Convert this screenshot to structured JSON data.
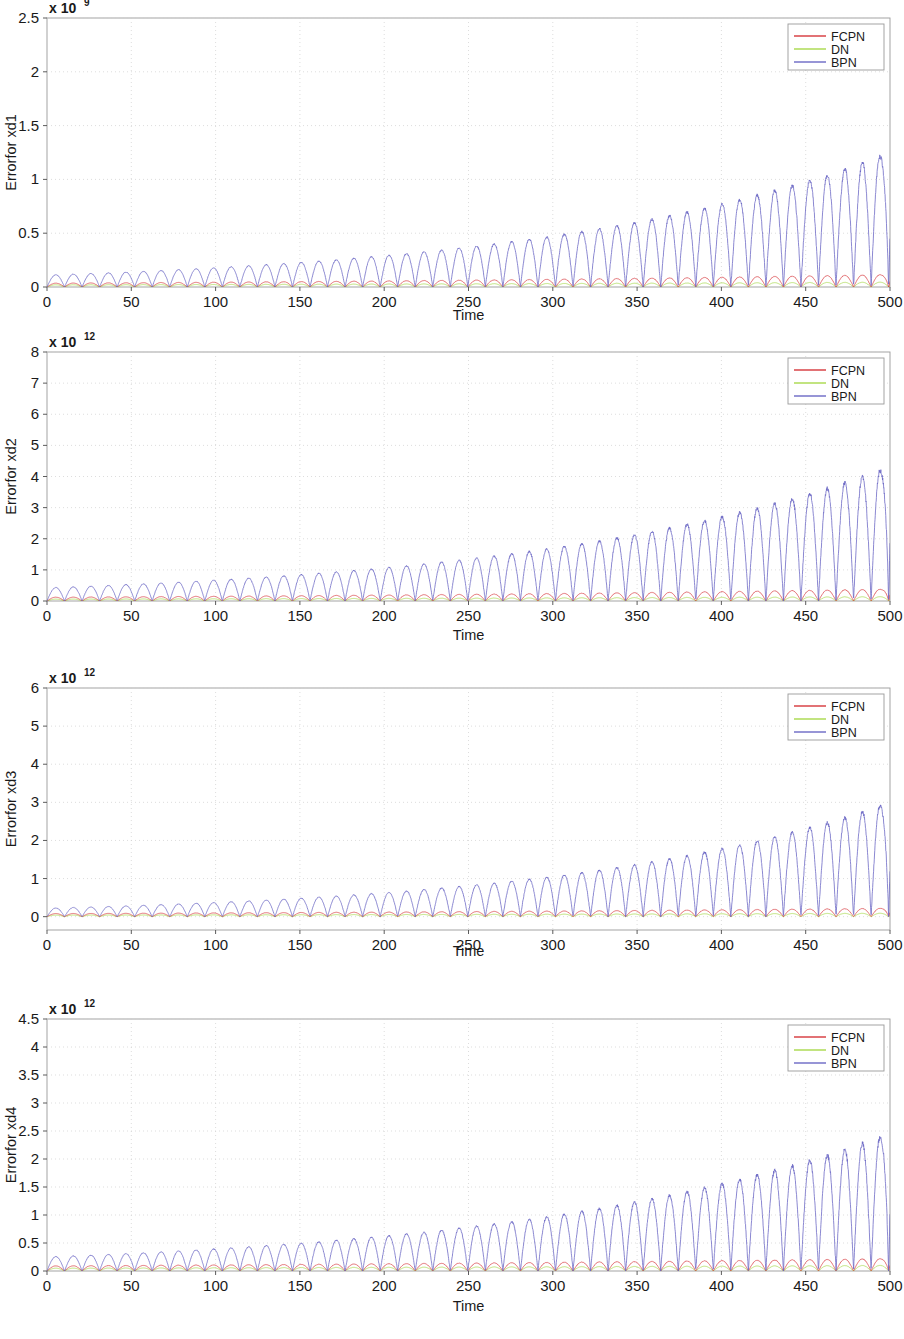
{
  "figure": {
    "type": "multi-panel-line-chart",
    "panel_count": 4,
    "background": "#ffffff"
  },
  "series_styles": {
    "FCPN": "#d6353a",
    "DN": "#a8d94a",
    "BPN": "#6a67c4"
  },
  "legend": {
    "position": "top-right",
    "entries": [
      {
        "label": "FCPN",
        "color": "#d6353a"
      },
      {
        "label": "DN",
        "color": "#a8d94a"
      },
      {
        "label": "BPN",
        "color": "#6a67c4"
      }
    ]
  },
  "chart_data": [
    {
      "type": "line",
      "title": "",
      "xlabel": "Time",
      "ylabel": "Errorfor xd1",
      "y_exponent_mantissa": "x 10",
      "y_exponent_power": "9",
      "y_scale": 1000000000.0,
      "xlim": [
        0,
        500
      ],
      "ylim": [
        0,
        2.5
      ],
      "xticks": [
        0,
        50,
        100,
        150,
        200,
        250,
        300,
        350,
        400,
        450,
        500
      ],
      "xticklabels": [
        "0",
        "50",
        "100",
        "150",
        "200",
        "250",
        "300",
        "350",
        "400",
        "450",
        "500"
      ],
      "yticks": [
        0,
        0.5,
        1,
        1.5,
        2,
        2.5
      ],
      "yticklabels": [
        "0",
        "0.5",
        "1",
        "1.5",
        "2",
        "2.5"
      ],
      "grid": true,
      "oscillation_period": 10.4,
      "series": [
        {
          "name": "FCPN",
          "color": "#d6353a",
          "envelope_start": 0.035,
          "envelope_end": 0.115,
          "growth": "exponential",
          "final_spike": 0.22
        },
        {
          "name": "DN",
          "color": "#a8d94a",
          "envelope_start": 0.02,
          "envelope_end": 0.045,
          "growth": "exponential",
          "final_spike": 0.06
        },
        {
          "name": "BPN",
          "color": "#6a67c4",
          "envelope_start": 0.11,
          "envelope_end": 1.25,
          "growth": "exponential",
          "final_spike": 2.0
        }
      ]
    },
    {
      "type": "line",
      "title": "",
      "xlabel": "Time",
      "ylabel": "Errorfor xd2",
      "y_exponent_mantissa": "x 10",
      "y_exponent_power": "12",
      "y_scale": 1000000000000.0,
      "xlim": [
        0,
        500
      ],
      "ylim": [
        0,
        8
      ],
      "xticks": [
        0,
        50,
        100,
        150,
        200,
        250,
        300,
        350,
        400,
        450,
        500
      ],
      "xticklabels": [
        "0",
        "50",
        "100",
        "150",
        "200",
        "250",
        "300",
        "350",
        "400",
        "450",
        "500"
      ],
      "yticks": [
        0,
        1,
        2,
        3,
        4,
        5,
        6,
        7,
        8
      ],
      "yticklabels": [
        "0",
        "1",
        "2",
        "3",
        "4",
        "5",
        "6",
        "7",
        "8"
      ],
      "grid": true,
      "oscillation_period": 10.4,
      "series": [
        {
          "name": "FCPN",
          "color": "#d6353a",
          "envelope_start": 0.12,
          "envelope_end": 0.38,
          "growth": "exponential",
          "final_spike": 0.85
        },
        {
          "name": "DN",
          "color": "#a8d94a",
          "envelope_start": 0.06,
          "envelope_end": 0.14,
          "growth": "exponential",
          "final_spike": 0.2
        },
        {
          "name": "BPN",
          "color": "#6a67c4",
          "envelope_start": 0.42,
          "envelope_end": 4.3,
          "growth": "exponential",
          "final_spike": 8.2
        }
      ]
    },
    {
      "type": "line",
      "title": "",
      "xlabel": "Time",
      "ylabel": "Errorfor xd3",
      "y_exponent_mantissa": "x 10",
      "y_exponent_power": "12",
      "y_scale": 1000000000000.0,
      "xlim": [
        0,
        500
      ],
      "ylim": [
        -0.35,
        6
      ],
      "xticks": [
        0,
        50,
        100,
        150,
        200,
        250,
        300,
        350,
        400,
        450,
        500
      ],
      "xticklabels": [
        "0",
        "50",
        "100",
        "150",
        "200",
        "250",
        "300",
        "350",
        "400",
        "450",
        "500"
      ],
      "yticks": [
        0,
        1,
        2,
        3,
        4,
        5,
        6
      ],
      "yticklabels": [
        "0",
        "1",
        "2",
        "3",
        "4",
        "5",
        "6"
      ],
      "grid": true,
      "oscillation_period": 10.4,
      "series": [
        {
          "name": "FCPN",
          "color": "#d6353a",
          "envelope_start": 0.08,
          "envelope_end": 0.22,
          "growth": "exponential",
          "final_spike": 0.45
        },
        {
          "name": "DN",
          "color": "#a8d94a",
          "envelope_start": 0.04,
          "envelope_end": 0.09,
          "growth": "exponential",
          "final_spike": 0.12
        },
        {
          "name": "BPN",
          "color": "#6a67c4",
          "envelope_start": 0.22,
          "envelope_end": 3.0,
          "growth": "exponential",
          "final_spike": 5.2
        }
      ]
    },
    {
      "type": "line",
      "title": "",
      "xlabel": "Time",
      "ylabel": "Errorfor xd4",
      "y_exponent_mantissa": "x 10",
      "y_exponent_power": "12",
      "y_scale": 1000000000000.0,
      "xlim": [
        0,
        500
      ],
      "ylim": [
        0,
        4.5
      ],
      "xticks": [
        0,
        50,
        100,
        150,
        200,
        250,
        300,
        350,
        400,
        450,
        500
      ],
      "xticklabels": [
        "0",
        "50",
        "100",
        "150",
        "200",
        "250",
        "300",
        "350",
        "400",
        "450",
        "500"
      ],
      "yticks": [
        0,
        0.5,
        1,
        1.5,
        2,
        2.5,
        3,
        3.5,
        4,
        4.5
      ],
      "yticklabels": [
        "0",
        "0.5",
        "1",
        "1.5",
        "2",
        "2.5",
        "3",
        "3.5",
        "4",
        "4.5"
      ],
      "grid": true,
      "oscillation_period": 10.4,
      "series": [
        {
          "name": "FCPN",
          "color": "#d6353a",
          "envelope_start": 0.09,
          "envelope_end": 0.22,
          "growth": "exponential",
          "final_spike": 0.42
        },
        {
          "name": "DN",
          "color": "#a8d94a",
          "envelope_start": 0.05,
          "envelope_end": 0.1,
          "growth": "exponential",
          "final_spike": 0.13
        },
        {
          "name": "BPN",
          "color": "#6a67c4",
          "envelope_start": 0.25,
          "envelope_end": 2.45,
          "growth": "exponential",
          "final_spike": 4.4
        }
      ]
    }
  ],
  "panel_geometry": [
    {
      "top": 0,
      "height": 330,
      "plot_left": 47,
      "plot_right": 890,
      "plot_top": 18,
      "plot_bottom": 287,
      "xaxis_label_y": 320
    },
    {
      "top": 330,
      "height": 332,
      "plot_left": 47,
      "plot_right": 890,
      "plot_top": 22,
      "plot_bottom": 271,
      "xaxis_label_y": 310
    },
    {
      "top": 662,
      "height": 333,
      "plot_left": 47,
      "plot_right": 890,
      "plot_top": 26,
      "plot_bottom": 268,
      "xaxis_label_y": 294
    },
    {
      "top": 995,
      "height": 344,
      "plot_left": 47,
      "plot_right": 890,
      "plot_top": 24,
      "plot_bottom": 276,
      "xaxis_label_y": 316
    }
  ]
}
